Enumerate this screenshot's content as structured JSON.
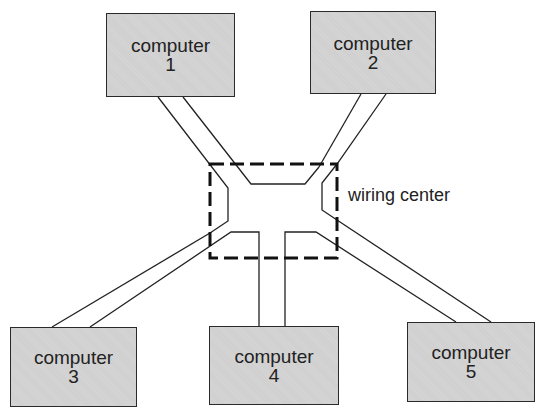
{
  "diagram": {
    "title": "",
    "type": "star network topology",
    "hub": {
      "label": "wiring center",
      "style": "dashed"
    },
    "nodes": [
      {
        "id": "computer-1",
        "label": "computer",
        "number": "1"
      },
      {
        "id": "computer-2",
        "label": "computer",
        "number": "2"
      },
      {
        "id": "computer-3",
        "label": "computer",
        "number": "3"
      },
      {
        "id": "computer-4",
        "label": "computer",
        "number": "4"
      },
      {
        "id": "computer-5",
        "label": "computer",
        "number": "5"
      }
    ],
    "edges": [
      {
        "from": "computer-1",
        "to": "wiring center"
      },
      {
        "from": "computer-2",
        "to": "wiring center"
      },
      {
        "from": "computer-3",
        "to": "wiring center"
      },
      {
        "from": "computer-4",
        "to": "wiring center"
      },
      {
        "from": "computer-5",
        "to": "wiring center"
      }
    ],
    "colors": {
      "box_fill": "#cfcfcf",
      "stroke": "#222222",
      "background": "#ffffff"
    }
  }
}
